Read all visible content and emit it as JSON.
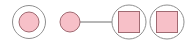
{
  "diagram": {
    "colors": {
      "fill": "#f7c0c8",
      "stroke_inner": "#a06a72",
      "stroke_outer": "#8a8a8a",
      "connector": "#6a6a6a",
      "background": "#ffffff"
    },
    "nodes": [
      {
        "id": "node-1",
        "shape": "circle",
        "ringed": true
      },
      {
        "id": "node-2",
        "shape": "circle",
        "ringed": false
      },
      {
        "id": "node-3",
        "shape": "square",
        "ringed": true
      },
      {
        "id": "node-4",
        "shape": "square",
        "ringed": true
      }
    ],
    "edges": [
      {
        "from": "node-2",
        "to": "node-3"
      }
    ]
  }
}
